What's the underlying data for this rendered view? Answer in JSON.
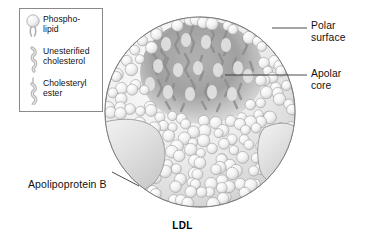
{
  "figure": {
    "caption": "LDL",
    "background_color": "#ffffff",
    "outline_color": "#6f6f6f"
  },
  "legend": {
    "border_color": "#8a8a8a",
    "items": [
      {
        "icon": "phospholipid-icon",
        "label": "Phospho-\nlipid"
      },
      {
        "icon": "unesterified-cholesterol-icon",
        "label": "Unesterified\ncholesterol"
      },
      {
        "icon": "cholesteryl-ester-icon",
        "label": "Cholesteryl\nester"
      }
    ]
  },
  "callouts": [
    {
      "name": "polar-surface",
      "label": "Polar\nsurface"
    },
    {
      "name": "apolar-core",
      "label": "Apolar\ncore"
    },
    {
      "name": "apolipoprotein-b",
      "label": "Apolipoprotein B"
    }
  ],
  "particle": {
    "name": "LDL particle",
    "center": [
      200,
      112
    ],
    "radius": 95,
    "shell_color": "#e8e8e8",
    "core_color": "#9e9e9e",
    "apoprotein_color": "#dcdcdc"
  }
}
